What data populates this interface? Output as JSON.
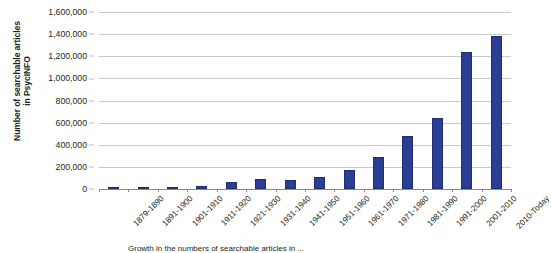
{
  "chart_data": {
    "type": "bar",
    "title": "",
    "xlabel": "Growth of searchable articles in PsycINFO",
    "ylabel": "Number of searchable articles in PsycINFO",
    "ylabel_line1": "Number of searchable articles",
    "ylabel_line2": "in PsycINFO",
    "categories": [
      "1879-1890",
      "1891-1900",
      "1901-1910",
      "1911-1920",
      "1921-1930",
      "1931-1940",
      "1941-1950",
      "1951-1960",
      "1961-1970",
      "1971-1980",
      "1981-1990",
      "1991-2000",
      "2001-2010",
      "2010-Today"
    ],
    "values": [
      20000,
      20000,
      20000,
      30000,
      60000,
      90000,
      80000,
      110000,
      170000,
      290000,
      480000,
      640000,
      1240000,
      1380000
    ],
    "ylim": [
      0,
      1600000
    ],
    "ytick_values": [
      "0",
      "200,000",
      "400,000",
      "600,000",
      "800,000",
      "1,000,000",
      "1,200,000",
      "1,400,000",
      "1,600,000"
    ],
    "ytick_numbers": [
      0,
      200000,
      400000,
      600000,
      800000,
      1000000,
      1200000,
      1400000,
      1600000
    ],
    "grid": true,
    "legend": "none",
    "bar_color": "#2a3f93",
    "grid_color": "#c9c9c9",
    "axis_color": "#8a8a8a",
    "background_color": "#ffffff"
  },
  "caption": {
    "text": "Growth in the numbers of searchable articles in ..."
  }
}
